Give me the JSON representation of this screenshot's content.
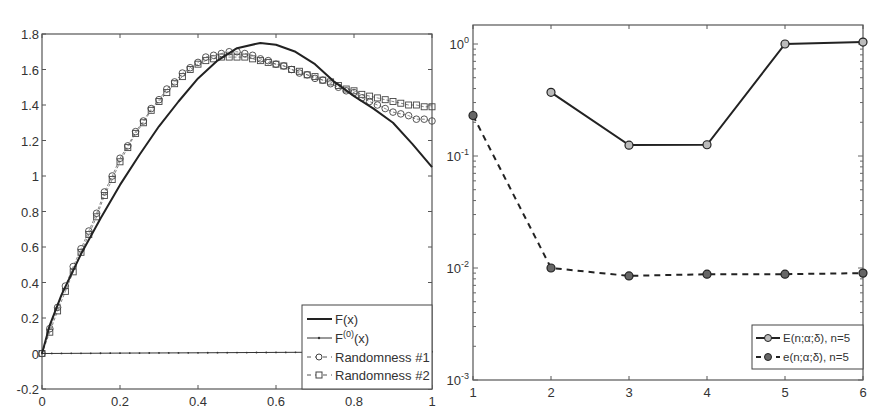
{
  "chart_data": [
    {
      "type": "line",
      "title": "",
      "xlabel": "",
      "ylabel": "",
      "xlim": [
        0,
        1
      ],
      "ylim": [
        -0.2,
        1.8
      ],
      "xticks": [
        "0",
        "0.2",
        "0.4",
        "0.6",
        "0.8",
        "1"
      ],
      "yticks": [
        "-0.2",
        "0",
        "0.2",
        "0.4",
        "0.6",
        "0.8",
        "1",
        "1.2",
        "1.4",
        "1.6",
        "1.8"
      ],
      "grid": false,
      "legend_position": "lower right",
      "series": [
        {
          "name": "F(x)",
          "style": "solid-thick",
          "x": [
            0,
            0.02,
            0.05,
            0.1,
            0.15,
            0.2,
            0.25,
            0.3,
            0.35,
            0.4,
            0.45,
            0.5,
            0.56,
            0.6,
            0.65,
            0.7,
            0.75,
            0.8,
            0.85,
            0.9,
            0.95,
            1.0
          ],
          "y": [
            0,
            0.16,
            0.33,
            0.56,
            0.76,
            0.95,
            1.12,
            1.28,
            1.42,
            1.55,
            1.65,
            1.72,
            1.75,
            1.74,
            1.7,
            1.63,
            1.53,
            1.45,
            1.38,
            1.3,
            1.18,
            1.05
          ]
        },
        {
          "name": "F^(0)(x)",
          "style": "solid-thin-dots",
          "x": [
            0,
            0.2,
            0.4,
            0.6,
            0.8,
            1.0
          ],
          "y": [
            0,
            0.002,
            0.004,
            0.006,
            0.008,
            0.01
          ]
        },
        {
          "name": "Randomness #1",
          "style": "dashed-circle",
          "x": [
            0,
            0.02,
            0.04,
            0.06,
            0.08,
            0.1,
            0.12,
            0.14,
            0.16,
            0.18,
            0.2,
            0.22,
            0.24,
            0.26,
            0.28,
            0.3,
            0.32,
            0.34,
            0.36,
            0.38,
            0.4,
            0.42,
            0.44,
            0.46,
            0.48,
            0.5,
            0.52,
            0.54,
            0.56,
            0.58,
            0.6,
            0.62,
            0.64,
            0.66,
            0.68,
            0.7,
            0.72,
            0.74,
            0.76,
            0.78,
            0.8,
            0.82,
            0.84,
            0.86,
            0.88,
            0.9,
            0.92,
            0.94,
            0.96,
            0.98,
            1.0
          ],
          "y": [
            0,
            0.14,
            0.26,
            0.38,
            0.49,
            0.59,
            0.69,
            0.79,
            0.91,
            1.0,
            1.1,
            1.17,
            1.25,
            1.31,
            1.38,
            1.43,
            1.49,
            1.53,
            1.58,
            1.61,
            1.64,
            1.67,
            1.68,
            1.69,
            1.7,
            1.7,
            1.69,
            1.68,
            1.66,
            1.65,
            1.63,
            1.62,
            1.6,
            1.58,
            1.57,
            1.55,
            1.54,
            1.52,
            1.5,
            1.48,
            1.47,
            1.44,
            1.42,
            1.4,
            1.38,
            1.36,
            1.35,
            1.34,
            1.32,
            1.32,
            1.31
          ]
        },
        {
          "name": "Randomness #2",
          "style": "dashed-square",
          "x": [
            0,
            0.02,
            0.04,
            0.06,
            0.08,
            0.1,
            0.12,
            0.14,
            0.16,
            0.18,
            0.2,
            0.22,
            0.24,
            0.26,
            0.28,
            0.3,
            0.32,
            0.34,
            0.36,
            0.38,
            0.4,
            0.42,
            0.44,
            0.46,
            0.48,
            0.5,
            0.52,
            0.54,
            0.56,
            0.58,
            0.6,
            0.62,
            0.64,
            0.66,
            0.68,
            0.7,
            0.72,
            0.74,
            0.76,
            0.78,
            0.8,
            0.82,
            0.84,
            0.86,
            0.88,
            0.9,
            0.92,
            0.94,
            0.96,
            0.98,
            1.0
          ],
          "y": [
            0,
            0.12,
            0.24,
            0.35,
            0.46,
            0.57,
            0.67,
            0.77,
            0.89,
            0.98,
            1.08,
            1.16,
            1.24,
            1.3,
            1.37,
            1.42,
            1.47,
            1.52,
            1.56,
            1.6,
            1.63,
            1.65,
            1.66,
            1.67,
            1.67,
            1.67,
            1.67,
            1.66,
            1.65,
            1.64,
            1.63,
            1.62,
            1.6,
            1.59,
            1.57,
            1.56,
            1.54,
            1.53,
            1.51,
            1.49,
            1.48,
            1.46,
            1.45,
            1.44,
            1.43,
            1.42,
            1.41,
            1.4,
            1.4,
            1.39,
            1.39
          ]
        }
      ]
    },
    {
      "type": "line",
      "title": "",
      "xlabel": "",
      "ylabel": "",
      "yscale": "log",
      "xlim": [
        1,
        6
      ],
      "ylim": [
        0.001,
        1.5
      ],
      "xticks": [
        "1",
        "2",
        "3",
        "4",
        "5",
        "6"
      ],
      "yticks": [
        {
          "base": "10",
          "exp": "0"
        },
        {
          "base": "10",
          "exp": "-1"
        },
        {
          "base": "10",
          "exp": "-2"
        },
        {
          "base": "10",
          "exp": "-3"
        }
      ],
      "grid": false,
      "legend_position": "lower right",
      "series": [
        {
          "name": "E(n;α;δ), n=5",
          "style": "solid-circle",
          "x": [
            2,
            3,
            4,
            5,
            6
          ],
          "y": [
            0.37,
            0.125,
            0.126,
            1.0,
            1.04
          ]
        },
        {
          "name": "e(n;α;δ), n=5",
          "style": "dashed-filled-circle",
          "x": [
            1,
            2,
            3,
            4,
            5,
            6
          ],
          "y": [
            0.23,
            0.01,
            0.0085,
            0.0088,
            0.0088,
            0.009
          ]
        }
      ]
    }
  ]
}
